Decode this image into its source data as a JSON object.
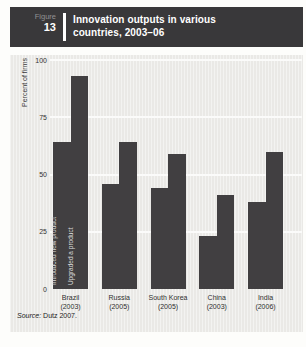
{
  "header": {
    "figure_label": "Figure",
    "figure_number": "13",
    "title_line1": "Innovation outputs in various",
    "title_line2": "countries, 2003–06"
  },
  "chart_data": {
    "type": "bar",
    "title": "Innovation outputs in various countries, 2003–06",
    "ylabel": "Percent of firms",
    "ylim": [
      0,
      100
    ],
    "yticks": [
      0,
      25,
      50,
      75,
      100
    ],
    "grid": "horizontal white gridlines at 25, 50, 75, 100",
    "legend_position": "vertical white labels inside first bar group",
    "categories": [
      {
        "label": "Brazil",
        "year": "(2003)"
      },
      {
        "label": "Russia",
        "year": "(2005)"
      },
      {
        "label": "South Korea",
        "year": "(2005)"
      },
      {
        "label": "China",
        "year": "(2003)"
      },
      {
        "label": "India",
        "year": "(2006)"
      }
    ],
    "series": [
      {
        "name": "Introduced new product",
        "values": [
          64,
          46,
          44,
          23,
          38
        ]
      },
      {
        "name": "Upgraded a product",
        "values": [
          93,
          64,
          59,
          41,
          60
        ]
      }
    ],
    "bar_color": "#413f41",
    "plot_bg": "#eae9e6"
  },
  "source": {
    "label": "Source:",
    "text": " Dutz 2007."
  }
}
